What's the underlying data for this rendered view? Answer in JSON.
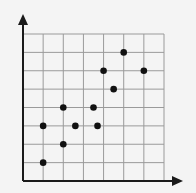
{
  "chart_data": {
    "type": "scatter",
    "title": "",
    "xlabel": "",
    "ylabel": "",
    "xlim": [
      0,
      7
    ],
    "ylim": [
      0,
      8
    ],
    "grid": true,
    "x_gridlines": [
      0,
      1,
      2,
      3,
      4,
      5,
      6,
      7
    ],
    "y_gridlines": [
      0,
      1,
      2,
      3,
      4,
      5,
      6,
      7,
      8
    ],
    "points": [
      {
        "x": 1,
        "y": 1
      },
      {
        "x": 1,
        "y": 3
      },
      {
        "x": 2,
        "y": 2
      },
      {
        "x": 2,
        "y": 4
      },
      {
        "x": 2.6,
        "y": 3
      },
      {
        "x": 3.5,
        "y": 4
      },
      {
        "x": 3.7,
        "y": 3
      },
      {
        "x": 4,
        "y": 6
      },
      {
        "x": 4.5,
        "y": 5
      },
      {
        "x": 5,
        "y": 7
      },
      {
        "x": 6,
        "y": 6
      }
    ],
    "colors": {
      "point": "#111111",
      "grid": "#9a9a9a",
      "axis": "#1a1a1a",
      "background": "#f4f4f4"
    }
  }
}
